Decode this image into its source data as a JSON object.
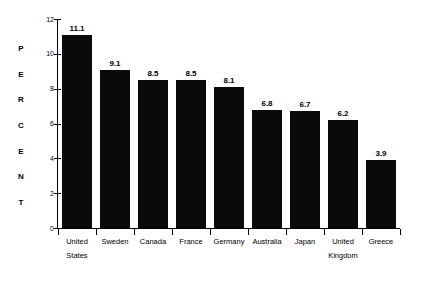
{
  "chart_data": {
    "type": "bar",
    "title": "",
    "subtitle": "",
    "xlabel": "",
    "ylabel": "PERCENT",
    "ylabel_letters": [
      "P",
      "E",
      "R",
      "C",
      "E",
      "N",
      "T"
    ],
    "categories": [
      "United States",
      "Sweden",
      "Canada",
      "France",
      "Germany",
      "Australia",
      "Japan",
      "United Kingdom",
      "Greece"
    ],
    "category_lines": [
      [
        "United",
        "States"
      ],
      [
        "Sweden",
        ""
      ],
      [
        "Canada",
        ""
      ],
      [
        "France",
        ""
      ],
      [
        "Germany",
        ""
      ],
      [
        "Australia",
        ""
      ],
      [
        "Japan",
        ""
      ],
      [
        "United",
        "Kingdom"
      ],
      [
        "Greece",
        ""
      ]
    ],
    "values": [
      11.1,
      9.1,
      8.5,
      8.5,
      8.1,
      6.8,
      6.7,
      6.2,
      3.9
    ],
    "value_labels": [
      "11.1",
      "9.1",
      "8.5",
      "8.5",
      "8.1",
      "6.8",
      "6.7",
      "6.2",
      "3.9"
    ],
    "ylim": [
      0,
      12
    ],
    "yticks": [
      0,
      2,
      4,
      6,
      8,
      10,
      12
    ],
    "ytick_labels": [
      "0",
      "2",
      "4",
      "6",
      "8",
      "10",
      "12"
    ],
    "grid": false,
    "legend": false,
    "legend_position": "none",
    "bar_color": "#0a0a0a",
    "background_color": "#ffffff",
    "axis_color": "#000000",
    "text_color": "#000000"
  }
}
